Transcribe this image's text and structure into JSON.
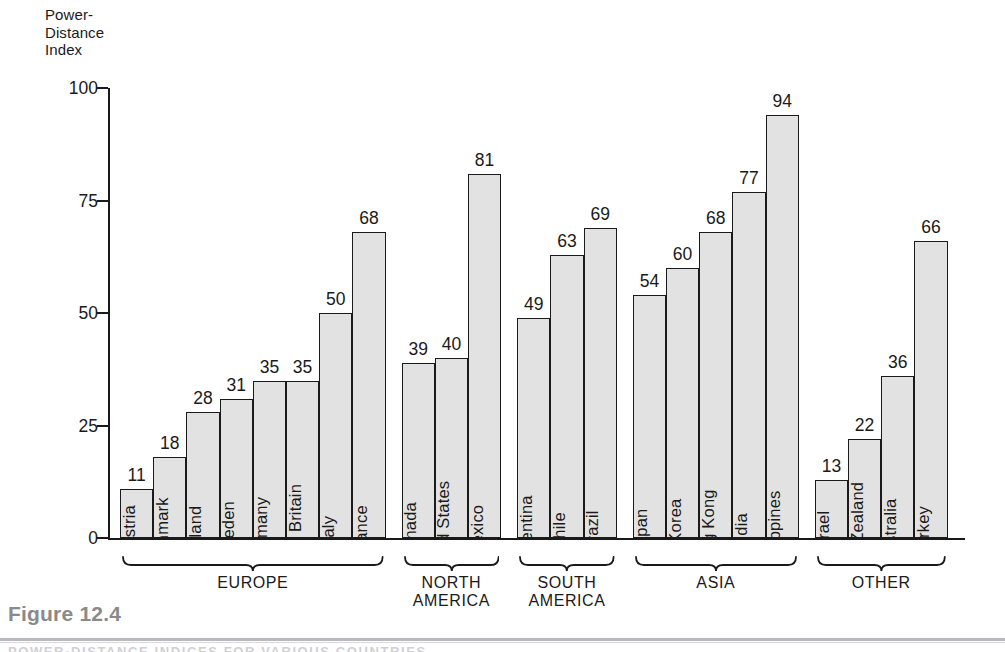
{
  "figure": {
    "caption_label": "Figure 12.4",
    "caption_subtext": "POWER-DISTANCE INDICES FOR VARIOUS COUNTRIES"
  },
  "chart_data": {
    "type": "bar",
    "title": "",
    "ylabel": "Power-\nDistance\nIndex",
    "ylabel_lines": [
      "Power-",
      "Distance",
      "Index"
    ],
    "xlabel": "",
    "ylim": [
      0,
      100
    ],
    "yticks": [
      0,
      25,
      50,
      75,
      100
    ],
    "ytick_labels": [
      "0",
      "25",
      "50",
      "75",
      "100"
    ],
    "grid": false,
    "legend": "none",
    "bar_fill": "#e2e2e2",
    "bar_edge": "#1a1a1a",
    "categories": [
      "Austria",
      "Denmark",
      "Ireland",
      "Sweden",
      "Germany",
      "Great Britain",
      "Italy",
      "France",
      "Canada",
      "United States",
      "Mexico",
      "Argentina",
      "Chile",
      "Brazil",
      "Japan",
      "S. Korea",
      "Hong Kong",
      "India",
      "Philippines",
      "Israel",
      "New Zealand",
      "Australia",
      "Turkey"
    ],
    "values": [
      11,
      18,
      28,
      31,
      35,
      35,
      50,
      68,
      39,
      40,
      81,
      49,
      63,
      69,
      54,
      60,
      68,
      77,
      94,
      13,
      22,
      36,
      66
    ],
    "groups": [
      {
        "label": "EUROPE",
        "items": [
          {
            "name": "Austria",
            "value": 11
          },
          {
            "name": "Denmark",
            "value": 18
          },
          {
            "name": "Ireland",
            "value": 28
          },
          {
            "name": "Sweden",
            "value": 31
          },
          {
            "name": "Germany",
            "value": 35
          },
          {
            "name": "Great Britain",
            "value": 35
          },
          {
            "name": "Italy",
            "value": 50
          },
          {
            "name": "France",
            "value": 68
          }
        ]
      },
      {
        "label": "NORTH\nAMERICA",
        "items": [
          {
            "name": "Canada",
            "value": 39
          },
          {
            "name": "United States",
            "value": 40
          },
          {
            "name": "Mexico",
            "value": 81
          }
        ]
      },
      {
        "label": "SOUTH\nAMERICA",
        "items": [
          {
            "name": "Argentina",
            "value": 49
          },
          {
            "name": "Chile",
            "value": 63
          },
          {
            "name": "Brazil",
            "value": 69
          }
        ]
      },
      {
        "label": "ASIA",
        "items": [
          {
            "name": "Japan",
            "value": 54
          },
          {
            "name": "S. Korea",
            "value": 60
          },
          {
            "name": "Hong Kong",
            "value": 68
          },
          {
            "name": "India",
            "value": 77
          },
          {
            "name": "Philippines",
            "value": 94
          }
        ]
      },
      {
        "label": "OTHER",
        "items": [
          {
            "name": "Israel",
            "value": 13
          },
          {
            "name": "New Zealand",
            "value": 22
          },
          {
            "name": "Australia",
            "value": 36
          },
          {
            "name": "Turkey",
            "value": 66
          }
        ]
      }
    ]
  }
}
